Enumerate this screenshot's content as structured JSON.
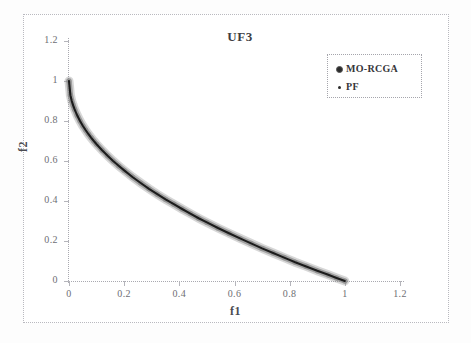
{
  "chart_data": {
    "type": "scatter",
    "title": "UF3",
    "xlabel": "f1",
    "ylabel": "f2",
    "xlim": [
      0,
      1.2
    ],
    "ylim": [
      0,
      1.2
    ],
    "grid": false,
    "legend_position": "top-right",
    "xticks": [
      "0",
      "0.2",
      "0.4",
      "0.6",
      "0.8",
      "1",
      "1.2"
    ],
    "xtick_values": [
      0,
      0.2,
      0.4,
      0.6,
      0.8,
      1,
      1.2
    ],
    "yticks": [
      "0",
      "0.2",
      "0.4",
      "0.6",
      "0.8",
      "1",
      "1.2"
    ],
    "ytick_values": [
      0,
      0.2,
      0.4,
      0.6,
      0.8,
      1,
      1.2
    ],
    "series": [
      {
        "name": "MO-RCGA",
        "marker": "circle",
        "color": "#8c8c8c",
        "x": [
          0.0,
          0.005,
          0.01,
          0.015,
          0.02,
          0.03,
          0.04,
          0.05,
          0.06,
          0.07,
          0.08,
          0.09,
          0.1,
          0.12,
          0.14,
          0.16,
          0.18,
          0.2,
          0.23,
          0.26,
          0.29,
          0.32,
          0.35,
          0.38,
          0.41,
          0.44,
          0.47,
          0.5,
          0.54,
          0.58,
          0.62,
          0.66,
          0.7,
          0.74,
          0.78,
          0.82,
          0.86,
          0.9,
          0.94,
          0.97,
          1.0
        ],
        "y": [
          1.0,
          0.929,
          0.9,
          0.878,
          0.859,
          0.827,
          0.8,
          0.776,
          0.755,
          0.735,
          0.717,
          0.7,
          0.684,
          0.654,
          0.626,
          0.6,
          0.576,
          0.553,
          0.52,
          0.49,
          0.461,
          0.434,
          0.408,
          0.384,
          0.36,
          0.337,
          0.314,
          0.293,
          0.265,
          0.239,
          0.213,
          0.188,
          0.163,
          0.14,
          0.117,
          0.094,
          0.073,
          0.051,
          0.031,
          0.015,
          0.0
        ]
      },
      {
        "name": "PF",
        "marker": "dot",
        "color": "#1c1c1c",
        "x": [
          0.0,
          0.005,
          0.01,
          0.015,
          0.02,
          0.03,
          0.04,
          0.05,
          0.06,
          0.07,
          0.08,
          0.09,
          0.1,
          0.12,
          0.14,
          0.16,
          0.18,
          0.2,
          0.23,
          0.26,
          0.29,
          0.32,
          0.35,
          0.38,
          0.41,
          0.44,
          0.47,
          0.5,
          0.54,
          0.58,
          0.62,
          0.66,
          0.7,
          0.74,
          0.78,
          0.82,
          0.86,
          0.9,
          0.94,
          0.97,
          1.0
        ],
        "y": [
          1.0,
          0.929,
          0.9,
          0.878,
          0.859,
          0.827,
          0.8,
          0.776,
          0.755,
          0.735,
          0.717,
          0.7,
          0.684,
          0.654,
          0.626,
          0.6,
          0.576,
          0.553,
          0.52,
          0.49,
          0.461,
          0.434,
          0.408,
          0.384,
          0.36,
          0.337,
          0.314,
          0.293,
          0.265,
          0.239,
          0.213,
          0.188,
          0.163,
          0.14,
          0.117,
          0.094,
          0.073,
          0.051,
          0.031,
          0.015,
          0.0
        ]
      }
    ],
    "legend": [
      {
        "label": "MO-RCGA",
        "marker": "circle"
      },
      {
        "label": "PF",
        "marker": "dot"
      }
    ]
  },
  "colors": {
    "morcga": "#8c8c8c",
    "pf": "#1c1c1c",
    "axis": "#a9a9b0",
    "text": "#6e6e74"
  }
}
